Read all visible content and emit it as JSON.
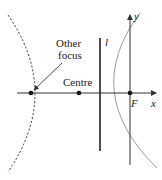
{
  "diagram": {
    "labels": {
      "other_focus_line1": "Other",
      "other_focus_line2": "focus",
      "centre": "Centre",
      "directrix": "l",
      "focus": "F",
      "x_axis": "x",
      "y_axis": "y"
    },
    "points": [
      {
        "name": "Other focus",
        "x": 31,
        "y": 93
      },
      {
        "name": "Centre",
        "x": 79,
        "y": 93
      },
      {
        "name": "F",
        "x": 130,
        "y": 93
      }
    ],
    "curves": [
      {
        "name": "right-branch",
        "style": "solid",
        "color": "#9a9a9a"
      },
      {
        "name": "left-branch",
        "style": "dashed",
        "color": "#333333"
      }
    ],
    "colors": {
      "axis": "#333333",
      "directrix": "#222222",
      "right_branch": "#9a9a9a",
      "left_branch": "#333333",
      "point": "#111111"
    }
  }
}
